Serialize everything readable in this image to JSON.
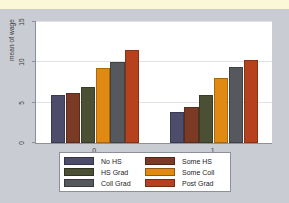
{
  "chart_data": {
    "type": "bar",
    "title": "",
    "xlabel": "",
    "ylabel": "mean of wage",
    "categories": [
      "0",
      "1"
    ],
    "ylim": [
      0,
      15
    ],
    "yticks": [
      0,
      5,
      10,
      15
    ],
    "ytick_labels": [
      "0",
      "5",
      "10",
      "15"
    ],
    "grid": true,
    "legend_position": "bottom",
    "series": [
      {
        "name": "No HS",
        "color": "#4d4c6b",
        "values": [
          5.9,
          3.8
        ]
      },
      {
        "name": "Some HS",
        "color": "#7b3a23",
        "values": [
          6.2,
          4.5
        ]
      },
      {
        "name": "HS Grad",
        "color": "#4b4f33",
        "values": [
          7.0,
          6.0
        ]
      },
      {
        "name": "Some Coll",
        "color": "#e08a14",
        "values": [
          9.3,
          8.1
        ]
      },
      {
        "name": "Coll Grad",
        "color": "#55585c",
        "values": [
          10.0,
          9.4
        ]
      },
      {
        "name": "Post Grad",
        "color": "#b5421d",
        "values": [
          11.5,
          10.3
        ]
      }
    ]
  },
  "legend": {
    "columns": [
      [
        {
          "label": "No HS",
          "color": "#4d4c6b"
        },
        {
          "label": "HS Grad",
          "color": "#4b4f33"
        },
        {
          "label": "Coll Grad",
          "color": "#55585c"
        }
      ],
      [
        {
          "label": "Some HS",
          "color": "#7b3a23"
        },
        {
          "label": "Some Coll",
          "color": "#e08a14"
        },
        {
          "label": "Post Grad",
          "color": "#b5421d"
        }
      ]
    ]
  },
  "colors": {
    "page_background": "#c9ccd2",
    "top_strip": "#fbf8d8",
    "plot_background": "#ffffff",
    "axis": "#8d9099",
    "gridline": "#dfe2e6",
    "text": "#3b3b3b"
  }
}
